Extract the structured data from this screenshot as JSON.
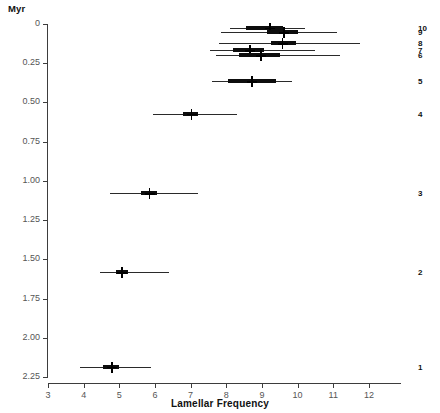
{
  "chart_data": {
    "type": "scatter",
    "title": "",
    "xlabel": "Lamellar Frequency",
    "ylabel": "Myr",
    "xlim": [
      3,
      12.9
    ],
    "ylim": [
      0,
      2.25
    ],
    "y_inverted": true,
    "grid": false,
    "legend": "none",
    "xticks": [
      3,
      4,
      5,
      6,
      7,
      8,
      9,
      10,
      11,
      12
    ],
    "xtick_labels": [
      "3",
      "4",
      "5",
      "6",
      "7",
      "8",
      "9",
      "10",
      "11",
      "12"
    ],
    "yticks": [
      0,
      0.25,
      0.5,
      0.75,
      1.0,
      1.25,
      1.5,
      1.75,
      2.0,
      2.25
    ],
    "ytick_labels": [
      "0",
      "0.25",
      "0.50",
      "0.75",
      "1.00",
      "1.25",
      "1.50",
      "1.75",
      "2.00",
      "2.25"
    ],
    "marker": "plus-with-error-bars",
    "series_label_position": "right",
    "points": [
      {
        "label": "10",
        "y": 0.03,
        "x": 9.2,
        "inner_low": 8.55,
        "inner_high": 9.6,
        "outer_low": 8.1,
        "outer_high": 10.2
      },
      {
        "label": "9",
        "y": 0.06,
        "x": 9.6,
        "inner_low": 9.15,
        "inner_high": 10.0,
        "outer_low": 7.85,
        "outer_high": 11.1
      },
      {
        "label": "8",
        "y": 0.13,
        "x": 9.55,
        "inner_low": 9.25,
        "inner_high": 9.95,
        "outer_low": 7.8,
        "outer_high": 11.75
      },
      {
        "label": "7",
        "y": 0.175,
        "x": 8.65,
        "inner_low": 8.2,
        "inner_high": 9.05,
        "outer_low": 7.55,
        "outer_high": 10.5
      },
      {
        "label": "6",
        "y": 0.205,
        "x": 8.95,
        "inner_low": 8.35,
        "inner_high": 9.5,
        "outer_low": 7.7,
        "outer_high": 11.2
      },
      {
        "label": "5",
        "y": 0.37,
        "x": 8.7,
        "inner_low": 8.05,
        "inner_high": 9.4,
        "outer_low": 7.6,
        "outer_high": 9.85
      },
      {
        "label": "4",
        "y": 0.58,
        "x": 7.0,
        "inner_low": 6.8,
        "inner_high": 7.2,
        "outer_low": 5.95,
        "outer_high": 8.3
      },
      {
        "label": "3",
        "y": 1.085,
        "x": 5.82,
        "inner_low": 5.6,
        "inner_high": 6.05,
        "outer_low": 4.75,
        "outer_high": 7.2
      },
      {
        "label": "2",
        "y": 1.59,
        "x": 5.05,
        "inner_low": 4.9,
        "inner_high": 5.25,
        "outer_low": 4.45,
        "outer_high": 6.4
      },
      {
        "label": "1",
        "y": 2.19,
        "x": 4.77,
        "inner_low": 4.55,
        "inner_high": 5.0,
        "outer_low": 3.9,
        "outer_high": 5.9
      }
    ]
  },
  "colors": {
    "axis": "#3d3d3d",
    "tick_label": "#555555",
    "data": "#0d0d0d",
    "background": "#ffffff"
  }
}
